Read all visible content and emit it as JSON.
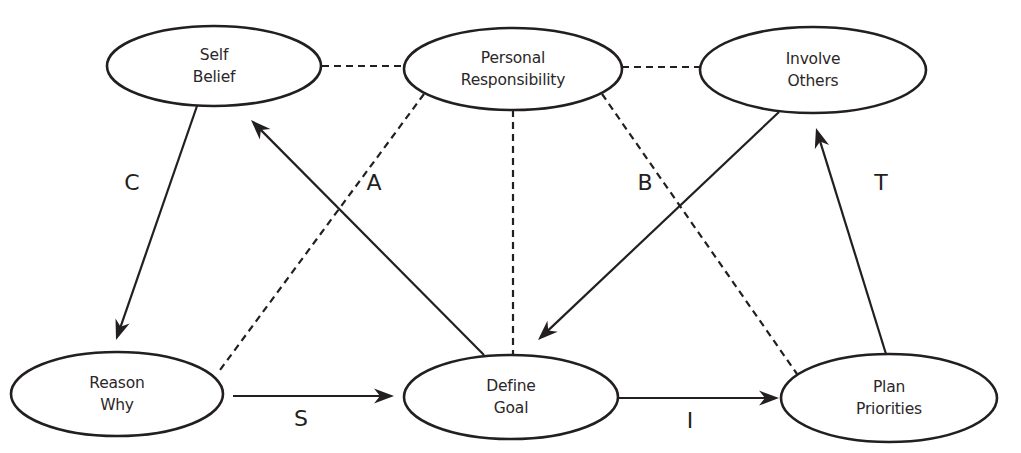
{
  "diagram": {
    "colors": {
      "stroke": "#231f20",
      "fill": "#ffffff",
      "text": "#2b2728"
    },
    "nodes": [
      {
        "id": "self_belief",
        "lines": [
          "Self",
          "Belief"
        ],
        "cx": 214,
        "cy": 66,
        "rx": 107,
        "ry": 40
      },
      {
        "id": "personal_responsibility",
        "lines": [
          "Personal",
          "Responsibility"
        ],
        "cx": 513,
        "cy": 69,
        "rx": 109,
        "ry": 41
      },
      {
        "id": "involve_others",
        "lines": [
          "Involve",
          "Others"
        ],
        "cx": 813,
        "cy": 70,
        "rx": 113,
        "ry": 43
      },
      {
        "id": "reason_why",
        "lines": [
          "Reason",
          "Why"
        ],
        "cx": 117,
        "cy": 394,
        "rx": 106,
        "ry": 42
      },
      {
        "id": "define_goal",
        "lines": [
          "Define",
          "Goal"
        ],
        "cx": 511,
        "cy": 397,
        "rx": 107,
        "ry": 42
      },
      {
        "id": "plan_priorities",
        "lines": [
          "Plan",
          "Priorities"
        ],
        "cx": 889,
        "cy": 398,
        "rx": 108,
        "ry": 44
      }
    ],
    "dashed_links": [
      {
        "from": "self_belief",
        "to": "personal_responsibility",
        "x1": 322,
        "y1": 66,
        "x2": 405,
        "y2": 66
      },
      {
        "from": "personal_responsibility",
        "to": "involve_others",
        "x1": 622,
        "y1": 67,
        "x2": 700,
        "y2": 67
      },
      {
        "from": "personal_responsibility",
        "to": "reason_why",
        "x1": 424,
        "y1": 94,
        "x2": 220,
        "y2": 370
      },
      {
        "from": "personal_responsibility",
        "to": "define_goal",
        "x1": 513,
        "y1": 110,
        "x2": 513,
        "y2": 355
      },
      {
        "from": "personal_responsibility",
        "to": "plan_priorities",
        "x1": 602,
        "y1": 94,
        "x2": 797,
        "y2": 374
      }
    ],
    "arrows": [
      {
        "label": "C",
        "from": "self_belief",
        "to": "reason_why",
        "x1": 197,
        "y1": 106,
        "x2": 116,
        "y2": 340,
        "label_x": 132,
        "label_y": 182
      },
      {
        "label": "A",
        "from": "define_goal",
        "to": "self_belief",
        "x1": 484,
        "y1": 355,
        "x2": 251,
        "y2": 120,
        "label_x": 374,
        "label_y": 182
      },
      {
        "label": "B",
        "from": "involve_others",
        "to": "define_goal",
        "x1": 779,
        "y1": 112,
        "x2": 538,
        "y2": 340,
        "label_x": 645,
        "label_y": 182
      },
      {
        "label": "T",
        "from": "plan_priorities",
        "to": "involve_others",
        "x1": 886,
        "y1": 354,
        "x2": 816,
        "y2": 128,
        "label_x": 881,
        "label_y": 182
      },
      {
        "label": "S",
        "from": "reason_why",
        "to": "define_goal",
        "x1": 233,
        "y1": 396,
        "x2": 394,
        "y2": 396,
        "label_x": 301,
        "label_y": 418
      },
      {
        "label": "I",
        "from": "define_goal",
        "to": "plan_priorities",
        "x1": 618,
        "y1": 398,
        "x2": 779,
        "y2": 398,
        "label_x": 690,
        "label_y": 420
      }
    ]
  }
}
